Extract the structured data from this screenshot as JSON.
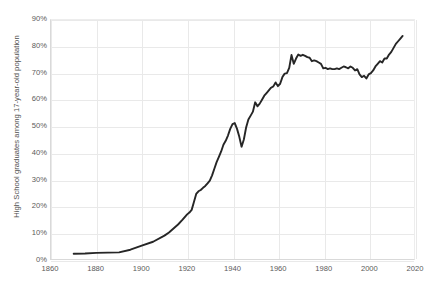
{
  "chart_data": {
    "type": "line",
    "title": "",
    "xlabel": "",
    "ylabel": "High School graduates among 17-year-old population",
    "xlim": [
      1860,
      2020
    ],
    "ylim": [
      0,
      90
    ],
    "grid": true,
    "legend": false,
    "line_color": "#262626",
    "grid_color": "#e9e9e9",
    "background_color": "#ffffff",
    "x_ticks": [
      "1860",
      "1880",
      "1900",
      "1920",
      "1940",
      "1960",
      "1980",
      "2000",
      "2020"
    ],
    "x_tick_values": [
      1860,
      1880,
      1900,
      1920,
      1940,
      1960,
      1980,
      2000,
      2020
    ],
    "y_ticks": [
      "0%",
      "10%",
      "20%",
      "30%",
      "40%",
      "50%",
      "60%",
      "70%",
      "80%",
      "90%"
    ],
    "y_tick_values": [
      0,
      10,
      20,
      30,
      40,
      50,
      60,
      70,
      80,
      90
    ],
    "series": [
      {
        "name": "High School graduates among 17-year-old population",
        "x": [
          1870,
          1875,
          1880,
          1885,
          1890,
          1895,
          1900,
          1905,
          1910,
          1912,
          1914,
          1916,
          1918,
          1920,
          1921,
          1922,
          1923,
          1924,
          1925,
          1926,
          1927,
          1928,
          1929,
          1930,
          1931,
          1932,
          1933,
          1934,
          1935,
          1936,
          1937,
          1938,
          1939,
          1940,
          1941,
          1942,
          1943,
          1944,
          1945,
          1946,
          1947,
          1948,
          1949,
          1950,
          1951,
          1952,
          1953,
          1954,
          1955,
          1956,
          1957,
          1958,
          1959,
          1960,
          1961,
          1962,
          1963,
          1964,
          1965,
          1966,
          1967,
          1968,
          1969,
          1970,
          1971,
          1972,
          1973,
          1974,
          1975,
          1976,
          1977,
          1978,
          1979,
          1980,
          1981,
          1982,
          1983,
          1984,
          1985,
          1986,
          1987,
          1988,
          1989,
          1990,
          1991,
          1992,
          1993,
          1994,
          1995,
          1996,
          1997,
          1998,
          1999,
          2000,
          2001,
          2002,
          2003,
          2004,
          2005,
          2006,
          2007,
          2008,
          2009,
          2010,
          2011,
          2012,
          2013,
          2014,
          2015
        ],
        "y": [
          2.0,
          2.1,
          2.3,
          2.4,
          2.5,
          3.5,
          5.0,
          6.5,
          8.8,
          10.0,
          11.5,
          13.0,
          14.8,
          16.8,
          17.5,
          18.5,
          21.5,
          24.5,
          25.5,
          26.0,
          26.8,
          27.5,
          28.5,
          29.5,
          31.5,
          34.0,
          36.5,
          38.5,
          40.5,
          43.0,
          44.5,
          46.5,
          49.0,
          50.8,
          51.2,
          49.0,
          46.0,
          42.3,
          45.0,
          49.5,
          52.5,
          54.0,
          55.5,
          59.0,
          57.5,
          58.5,
          60.0,
          61.5,
          62.5,
          63.5,
          64.5,
          65.0,
          66.5,
          65.1,
          66.0,
          68.5,
          69.8,
          70.0,
          72.0,
          76.8,
          73.5,
          75.5,
          77.0,
          76.5,
          76.9,
          76.5,
          76.0,
          75.8,
          74.5,
          74.8,
          74.5,
          74.0,
          73.5,
          71.8,
          72.0,
          71.5,
          71.8,
          71.5,
          71.5,
          71.8,
          71.5,
          72.0,
          72.5,
          72.2,
          71.8,
          72.5,
          72.0,
          71.0,
          71.5,
          69.5,
          68.5,
          69.0,
          68.0,
          69.5,
          70.0,
          71.0,
          72.5,
          73.5,
          74.5,
          74.0,
          75.5,
          75.5,
          77.0,
          78.0,
          79.5,
          81.0,
          82.0,
          83.0,
          84.0
        ]
      }
    ]
  }
}
